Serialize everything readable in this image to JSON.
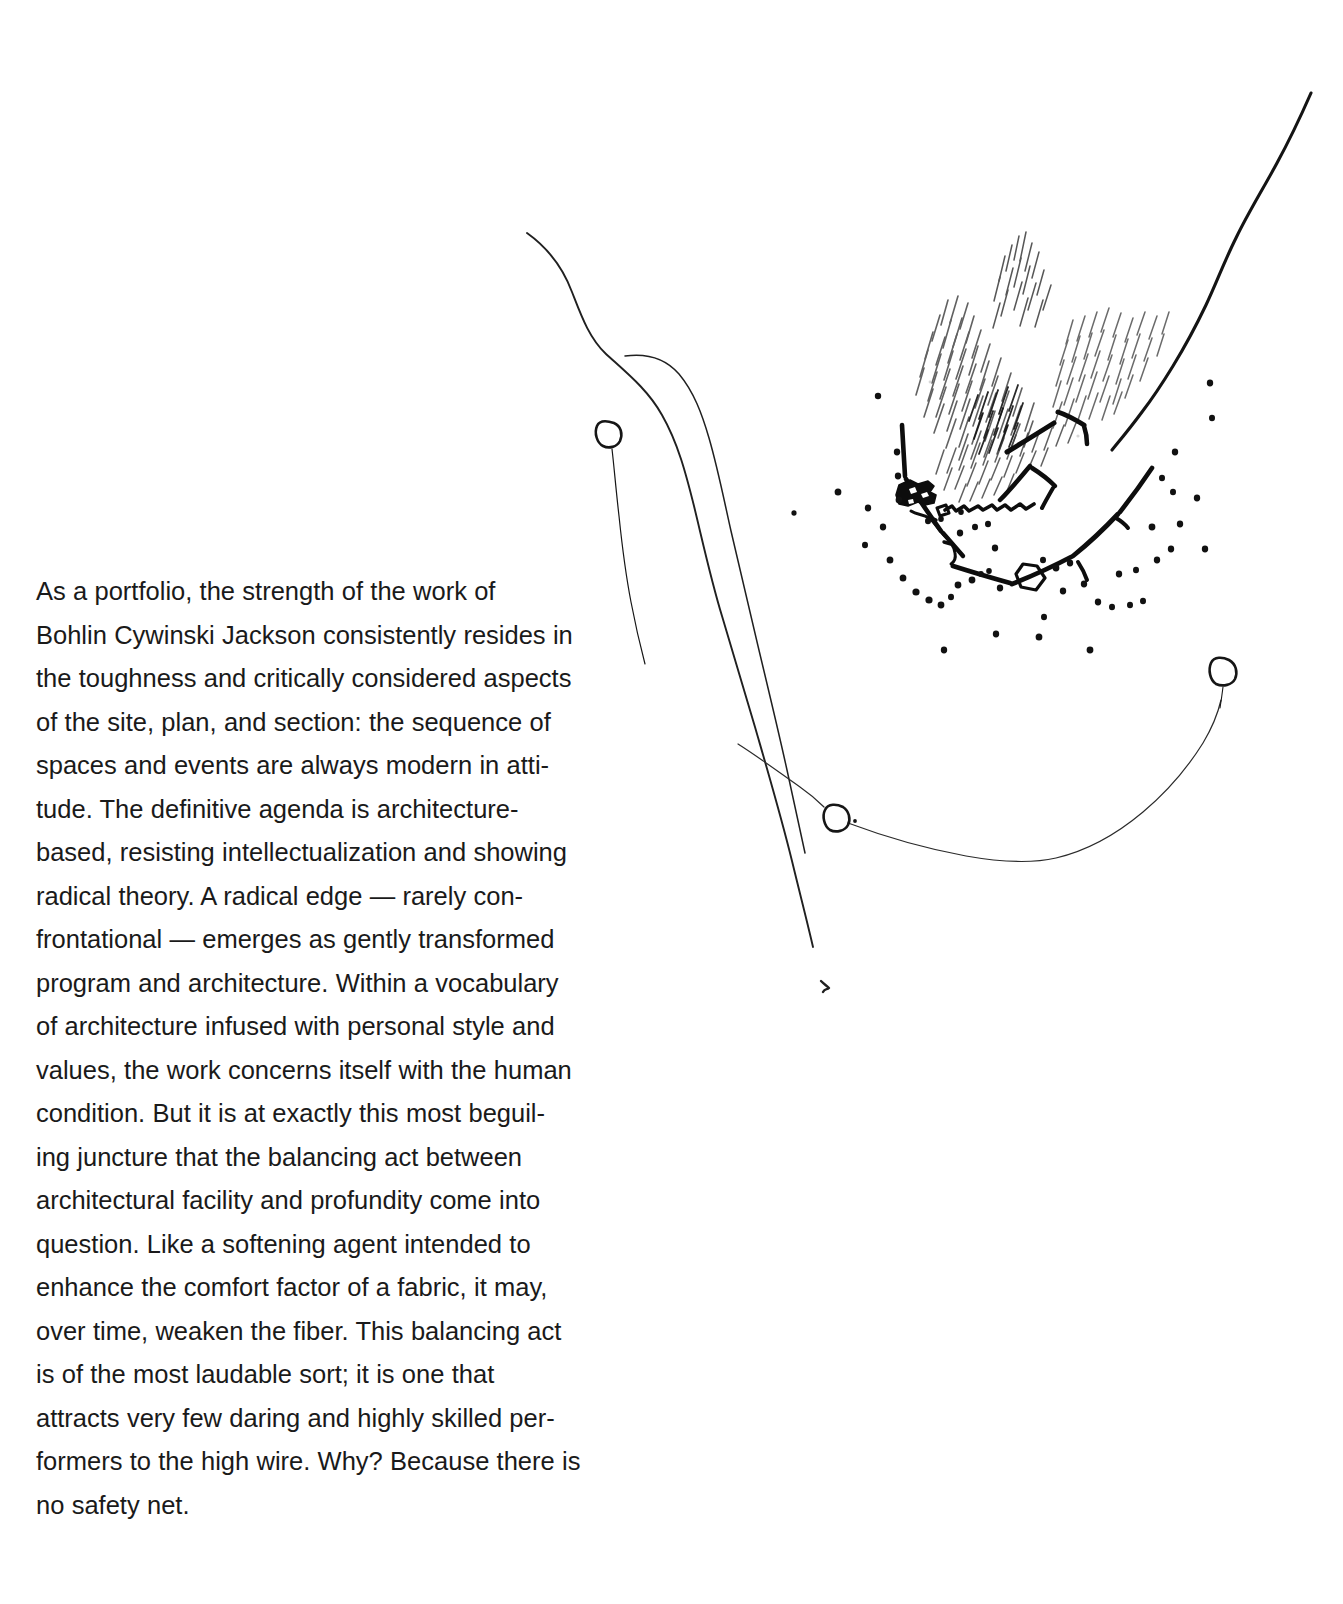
{
  "page": {
    "background_color": "#ffffff",
    "ink_color": "#1a1a1a",
    "width": 1343,
    "height": 1604
  },
  "article": {
    "paragraph": "    As a portfolio, the strength of the work of\nBohlin Cywinski Jackson consistently resides in\nthe toughness and critically considered aspects\nof the site, plan, and section: the sequence of\nspaces and events are always modern in atti-\ntude. The definitive agenda is architecture-\nbased, resisting intellectualization and showing\nradical theory. A radical edge — rarely con-\nfrontational  — emerges as gently transformed\nprogram and architecture. Within a vocabulary\nof architecture infused with personal style and\nvalues, the work concerns itself with the human\ncondition. But it  is at exactly this most beguil-\ning juncture that the balancing act between\narchitectural facility and profundity come into\nquestion. Like a softening agent intended to\nenhance the comfort factor of a fabric, it may,\nover time, weaken the fiber. This balancing act\nis of the most laudable sort; it is one that\nattracts very few daring and highly skilled per-\nformers to the high wire. Why? Because there is\nno safety net.",
    "lines": [
      "    As a portfolio, the strength of the work of",
      "Bohlin Cywinski Jackson consistently resides in",
      "the toughness and critically considered aspects",
      "of the site, plan, and section: the sequence of",
      "spaces and events are always modern in atti-",
      "tude. The definitive agenda is architecture-",
      "based, resisting intellectualization and showing",
      "radical theory. A radical edge — rarely con-",
      "frontational  — emerges as gently transformed",
      "program and architecture. Within a vocabulary",
      "of architecture infused with personal style and",
      "values, the work concerns itself with the human",
      "condition. But it  is at exactly this most beguil-",
      "ing juncture that the balancing act between",
      "architectural facility and profundity come into",
      "question. Like a softening agent intended to",
      "enhance the comfort factor of a fabric, it may,",
      "over time, weaken the fiber. This balancing act",
      "is of the most laudable sort; it is one that",
      "attracts very few daring and highly skilled per-",
      "formers to the high wire. Why? Because there is",
      "no safety net."
    ]
  },
  "illustration": {
    "kind": "hand-drawn-architectural-site-plan-sketch",
    "medium": "pencil and ink on white paper",
    "elements": [
      "road-double-curve-left",
      "road-bold-curve-upper-right",
      "contour-sweep-lower",
      "pencil-hatching-vegetation-mass",
      "bold-building-enclosure-lines",
      "dark-building-footprint",
      "pentagon-structure",
      "scattered-tree-dots",
      "survey-circle-markers",
      "north-arrow-tick"
    ],
    "markers": [
      {
        "name": "survey-circle-upper-left",
        "cx": 608,
        "cy": 434,
        "r": 13
      },
      {
        "name": "survey-circle-lower-left",
        "cx": 835,
        "cy": 817,
        "r": 13
      },
      {
        "name": "survey-circle-right",
        "cx": 1221,
        "cy": 671,
        "r": 13
      }
    ]
  }
}
